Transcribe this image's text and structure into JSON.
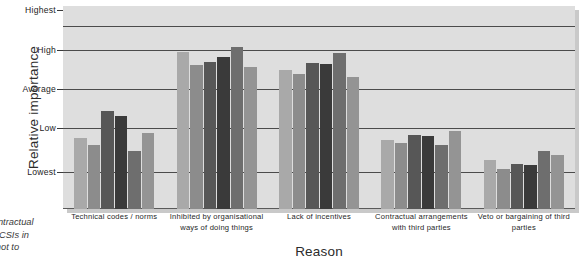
{
  "chart_data": {
    "type": "bar",
    "title": "",
    "xlabel": "Reason",
    "ylabel": "Relative importance",
    "grid": true,
    "legend": "none",
    "ytick_labels": [
      "Highest",
      "High",
      "Average",
      "Low",
      "Lowest"
    ],
    "ytick_values": [
      5,
      4,
      3,
      2,
      1
    ],
    "ylim": [
      0.3,
      5.3
    ],
    "categories": [
      "Technical codes / norms",
      "Inhibited by organisational ways of doing things",
      "Lack of incentives",
      "Contractual arrangements with third parties",
      "Veto or bargaining of third parties"
    ],
    "series": [
      {
        "name": "series-1",
        "color": "#a9a9a9",
        "values": [
          2.05,
          4.18,
          3.72,
          2.0,
          1.52
        ]
      },
      {
        "name": "series-2",
        "color": "#8c8c8c",
        "values": [
          1.88,
          3.85,
          3.62,
          1.92,
          1.28
        ]
      },
      {
        "name": "series-3",
        "color": "#575757",
        "values": [
          2.72,
          3.92,
          3.9,
          2.12,
          1.42
        ]
      },
      {
        "name": "series-4",
        "color": "#3a3a3a",
        "values": [
          2.58,
          4.05,
          3.88,
          2.1,
          1.38
        ]
      },
      {
        "name": "series-5",
        "color": "#6e6e6e",
        "values": [
          1.72,
          4.3,
          4.15,
          1.88,
          1.72
        ]
      },
      {
        "name": "series-6",
        "color": "#949494",
        "values": [
          2.18,
          3.8,
          3.55,
          2.22,
          1.62
        ]
      }
    ]
  },
  "caption": {
    "line1": "Contractual",
    "line2": "he CSIs in",
    "line3": "ct not to"
  }
}
